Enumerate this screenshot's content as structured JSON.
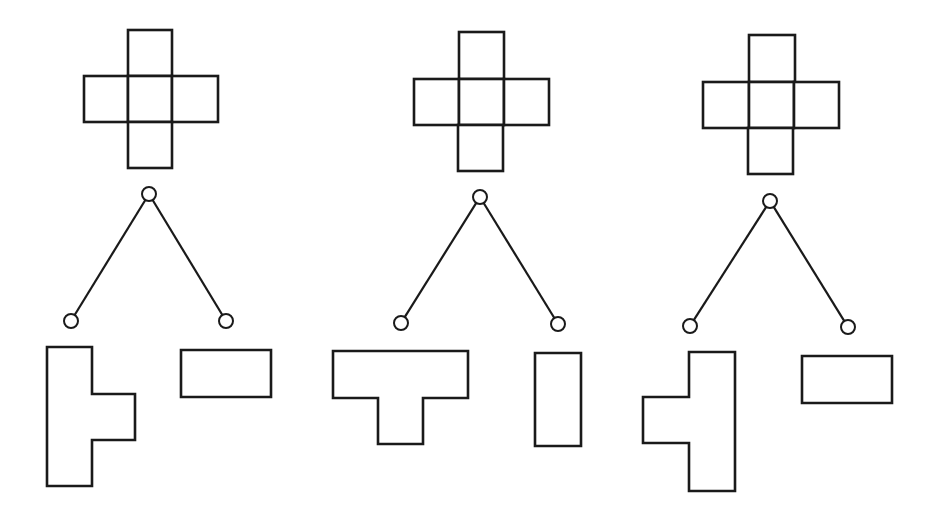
{
  "diagram": {
    "title": "",
    "colors": {
      "stroke": "#1a1a1a",
      "background": "#ffffff"
    },
    "panels": [
      {
        "id": "panel-1",
        "cross": {
          "squares": [
            {
              "x": 128,
              "y": 30,
              "w": 44,
              "h": 46
            },
            {
              "x": 84,
              "y": 76,
              "w": 44,
              "h": 46
            },
            {
              "x": 128,
              "y": 76,
              "w": 44,
              "h": 46
            },
            {
              "x": 172,
              "y": 76,
              "w": 46,
              "h": 46
            },
            {
              "x": 128,
              "y": 122,
              "w": 44,
              "h": 46
            }
          ]
        },
        "tree": {
          "root": {
            "x": 149,
            "y": 194
          },
          "left": {
            "x": 71,
            "y": 321
          },
          "right": {
            "x": 226,
            "y": 321
          },
          "r": 7
        },
        "left_piece": {
          "name": "T-tetromino pointing right",
          "points": "47,347 92,347 92,394 135,394 135,440 92,440 92,486 47,486"
        },
        "right_piece": {
          "name": "horizontal domino",
          "points": "181,350 271,350 271,397 181,397"
        }
      },
      {
        "id": "panel-2",
        "cross": {
          "squares": [
            {
              "x": 459,
              "y": 32,
              "w": 45,
              "h": 47
            },
            {
              "x": 414,
              "y": 79,
              "w": 45,
              "h": 46
            },
            {
              "x": 459,
              "y": 79,
              "w": 45,
              "h": 46
            },
            {
              "x": 504,
              "y": 79,
              "w": 45,
              "h": 46
            },
            {
              "x": 458,
              "y": 125,
              "w": 45,
              "h": 46
            }
          ]
        },
        "tree": {
          "root": {
            "x": 480,
            "y": 197
          },
          "left": {
            "x": 401,
            "y": 323
          },
          "right": {
            "x": 558,
            "y": 324
          },
          "r": 7
        },
        "left_piece": {
          "name": "T-tetromino pointing down",
          "points": "333,351 468,351 468,398 423,398 423,444 378,444 378,398 333,398"
        },
        "right_piece": {
          "name": "vertical domino",
          "points": "535,353 581,353 581,446 535,446"
        }
      },
      {
        "id": "panel-3",
        "cross": {
          "squares": [
            {
              "x": 749,
              "y": 35,
              "w": 46,
              "h": 47
            },
            {
              "x": 703,
              "y": 82,
              "w": 46,
              "h": 46
            },
            {
              "x": 749,
              "y": 82,
              "w": 45,
              "h": 46
            },
            {
              "x": 794,
              "y": 82,
              "w": 45,
              "h": 46
            },
            {
              "x": 748,
              "y": 128,
              "w": 45,
              "h": 46
            }
          ]
        },
        "tree": {
          "root": {
            "x": 770,
            "y": 201
          },
          "left": {
            "x": 690,
            "y": 326
          },
          "right": {
            "x": 848,
            "y": 327
          },
          "r": 7
        },
        "left_piece": {
          "name": "T-tetromino pointing left",
          "points": "689,352 735,352 735,491 689,491 689,443 643,443 643,397 689,397"
        },
        "right_piece": {
          "name": "horizontal domino",
          "points": "802,356 892,356 892,403 802,403"
        }
      }
    ]
  }
}
